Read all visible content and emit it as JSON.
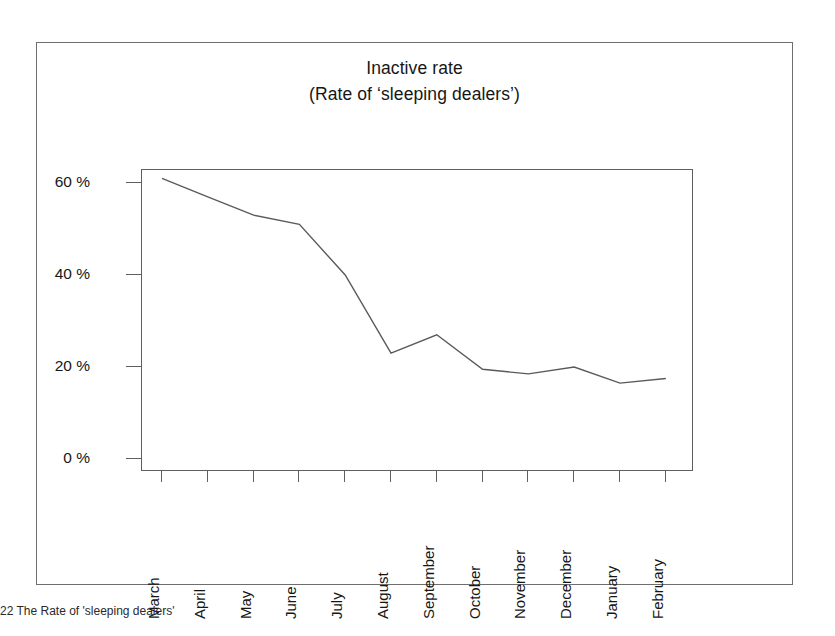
{
  "figure": {
    "frame_color": "#6e6e6e",
    "background": "#ffffff"
  },
  "caption": {
    "text": "22 The Rate of 'sleeping dealers'"
  },
  "chart_data": {
    "type": "line",
    "title": "Inactive rate",
    "subtitle": "(Rate of ‘sleeping dealers’)",
    "xlabel": "",
    "ylabel": "",
    "categories": [
      "March",
      "April",
      "May",
      "June",
      "July",
      "August",
      "September",
      "October",
      "November",
      "December",
      "January",
      "February"
    ],
    "values": [
      61,
      57,
      53,
      51,
      40,
      23,
      27,
      19.5,
      18.5,
      20,
      16.5,
      17.5
    ],
    "ylim": [
      0,
      65
    ],
    "y_ticks": [
      0,
      20,
      40,
      60
    ],
    "y_tick_labels": [
      "0 %",
      "20 %",
      "40 %",
      "60 %"
    ],
    "grid": false,
    "legend": false,
    "line_color": "#5a5a5a",
    "line_width": 1.4
  }
}
